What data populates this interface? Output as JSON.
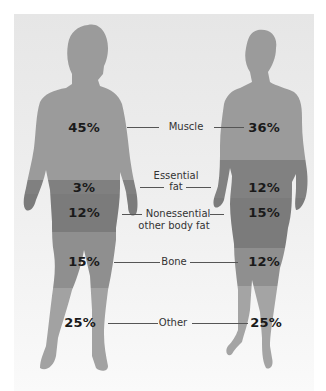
{
  "figure": {
    "title": "",
    "colors": {
      "background": "#eeeeee",
      "muscle": "#9a9a9a",
      "essential_fat": "#7e7e7e",
      "nonessential_fat": "#7a7a7a",
      "bone": "#8e8e8e",
      "other": "#a4a4a4"
    },
    "components": [
      {
        "label": "Muscle",
        "male": "45%",
        "female": "36%"
      },
      {
        "label": "Essential fat",
        "label_line1": "Essential",
        "label_line2": "fat",
        "male": "3%",
        "female": "12%"
      },
      {
        "label": "Nonessential other body fat",
        "label_line1": "Nonessential",
        "label_line2": "other body fat",
        "male": "12%",
        "female": "15%"
      },
      {
        "label": "Bone",
        "male": "15%",
        "female": "12%"
      },
      {
        "label": "Other",
        "male": "25%",
        "female": "25%"
      }
    ],
    "figures": [
      "male-silhouette",
      "female-silhouette"
    ]
  }
}
